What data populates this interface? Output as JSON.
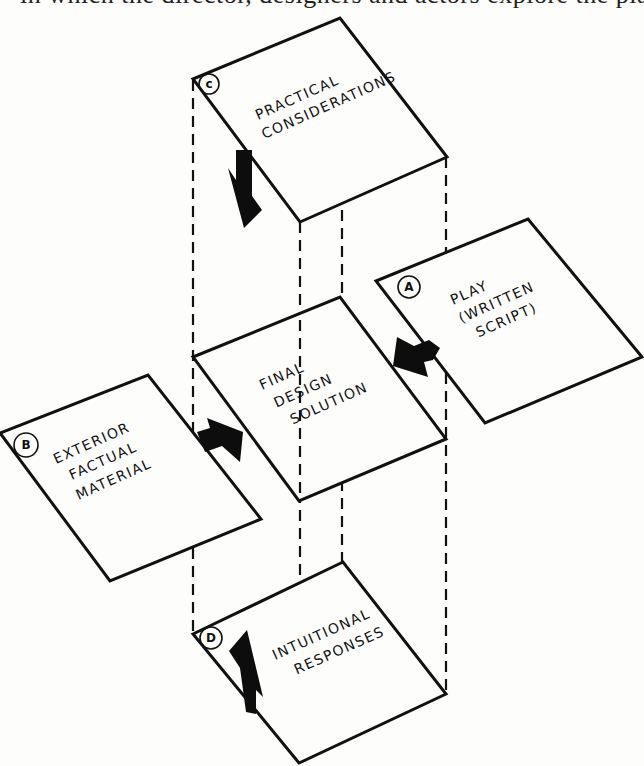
{
  "page_header_cutoff": "in which the director, designers and actors explore the play's imagery and...",
  "diagram": {
    "panels": [
      {
        "id": "C",
        "badge": "c",
        "lines": [
          "PRACTICAL",
          "CONSIDERATIONS"
        ],
        "arrow_direction": "down"
      },
      {
        "id": "A",
        "badge": "A",
        "lines": [
          "PLAY",
          "(WRITTEN",
          "SCRIPT)"
        ],
        "arrow_direction": "left"
      },
      {
        "id": "CENTER",
        "badge": "",
        "lines": [
          "FINAL",
          "DESIGN",
          "SOLUTION"
        ],
        "arrow_direction": ""
      },
      {
        "id": "B",
        "badge": "B",
        "lines": [
          "EXTERIOR",
          "FACTUAL",
          "MATERIAL"
        ],
        "arrow_direction": "right"
      },
      {
        "id": "D",
        "badge": "D",
        "lines": [
          "INTUITIONAL",
          "RESPONSES"
        ],
        "arrow_direction": "up"
      }
    ],
    "colors": {
      "ink": "#111111",
      "paper": "#fdfdfb"
    }
  }
}
